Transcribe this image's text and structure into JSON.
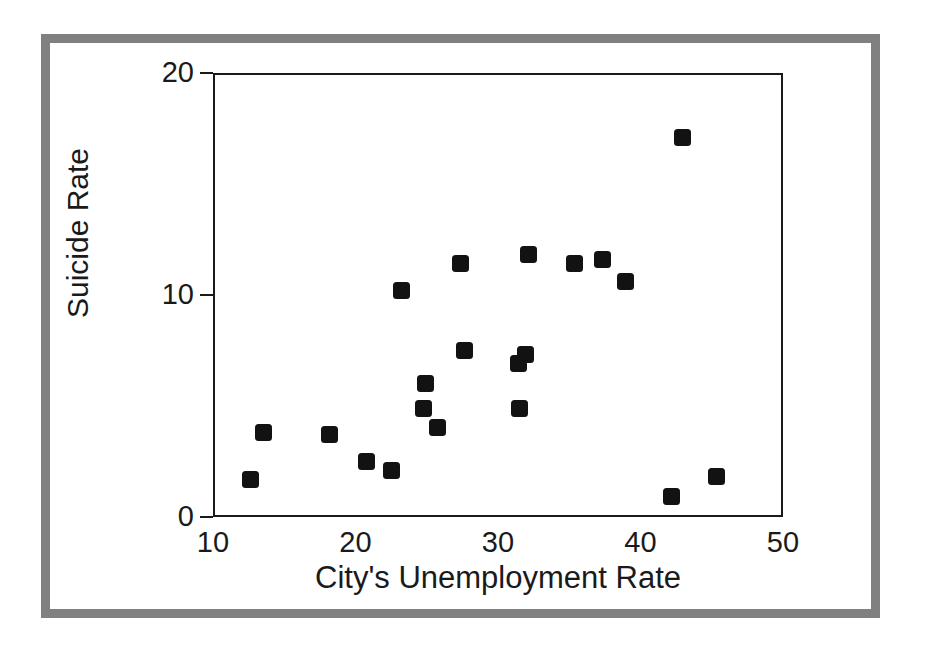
{
  "chart_data": {
    "type": "scatter",
    "title": "",
    "xlabel": "City's Unemployment Rate",
    "ylabel": "Suicide Rate",
    "xlim": [
      10,
      50
    ],
    "ylim": [
      0,
      20
    ],
    "xticks": [
      10,
      20,
      30,
      40,
      50
    ],
    "yticks": [
      0,
      10,
      20
    ],
    "xtick_labels": [
      "10",
      "20",
      "30",
      "40",
      "50"
    ],
    "ytick_labels": [
      "0",
      "10",
      "20"
    ],
    "grid": false,
    "legend": null,
    "marker": "square",
    "marker_color": "#121212",
    "series": [
      {
        "name": "Cities",
        "points": [
          {
            "x": 12.5,
            "y": 1.8
          },
          {
            "x": 13.4,
            "y": 3.9
          },
          {
            "x": 18.0,
            "y": 3.8
          },
          {
            "x": 20.6,
            "y": 2.6
          },
          {
            "x": 22.4,
            "y": 2.2
          },
          {
            "x": 23.1,
            "y": 10.3
          },
          {
            "x": 24.8,
            "y": 6.1
          },
          {
            "x": 24.6,
            "y": 5.0
          },
          {
            "x": 25.6,
            "y": 4.1
          },
          {
            "x": 27.2,
            "y": 11.5
          },
          {
            "x": 27.5,
            "y": 7.6
          },
          {
            "x": 31.3,
            "y": 7.0
          },
          {
            "x": 31.8,
            "y": 7.4
          },
          {
            "x": 31.4,
            "y": 5.0
          },
          {
            "x": 32.0,
            "y": 11.9
          },
          {
            "x": 35.2,
            "y": 11.5
          },
          {
            "x": 37.2,
            "y": 11.7
          },
          {
            "x": 38.8,
            "y": 10.7
          },
          {
            "x": 42.0,
            "y": 1.0
          },
          {
            "x": 42.8,
            "y": 17.2
          },
          {
            "x": 45.2,
            "y": 1.9
          }
        ]
      }
    ]
  },
  "axes": {
    "y_title": "Suicide Rate",
    "x_title": "City's Unemployment Rate",
    "y_labels": [
      "20",
      "10",
      "0"
    ],
    "x_labels": [
      "10",
      "20",
      "30",
      "40",
      "50"
    ]
  },
  "colors": {
    "frame": "#808080",
    "axis": "#1a1a1a",
    "marker": "#121212",
    "background": "#ffffff"
  }
}
